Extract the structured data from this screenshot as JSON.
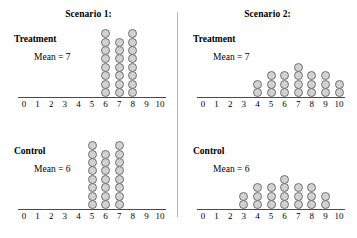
{
  "figure": {
    "axis": {
      "min": 0,
      "max": 10,
      "tick_labels": [
        "0",
        "1",
        "2",
        "3",
        "4",
        "5",
        "6",
        "7",
        "8",
        "9",
        "10"
      ]
    },
    "style": {
      "dot_fill": "#d2d2d2",
      "dot_stroke": "#6f6f6f",
      "axis_color": "#4a4a4a",
      "divider_color": "#b9b9b9",
      "text_color": "#000000"
    }
  },
  "scenarios": [
    {
      "title": "Scenario 1:",
      "panels": [
        {
          "group_label": "Treatment",
          "mean_label": "Mean = 7",
          "chart_data": {
            "type": "bar",
            "title": "Scenario 1: Treatment",
            "subtitle": "Mean = 7",
            "xlabel": "",
            "ylabel": "",
            "categories": [
              "0",
              "1",
              "2",
              "3",
              "4",
              "5",
              "6",
              "7",
              "8",
              "9",
              "10"
            ],
            "values": [
              0,
              0,
              0,
              0,
              0,
              0,
              8,
              7,
              8,
              0,
              0
            ],
            "xlim": [
              0,
              10
            ],
            "ylim": [
              0,
              8
            ],
            "grid": false,
            "legend": "none",
            "mean": 7,
            "n": 23
          }
        },
        {
          "group_label": "Control",
          "mean_label": "Mean = 6",
          "chart_data": {
            "type": "bar",
            "title": "Scenario 1: Control",
            "subtitle": "Mean = 6",
            "xlabel": "",
            "ylabel": "",
            "categories": [
              "0",
              "1",
              "2",
              "3",
              "4",
              "5",
              "6",
              "7",
              "8",
              "9",
              "10"
            ],
            "values": [
              0,
              0,
              0,
              0,
              0,
              8,
              7,
              8,
              0,
              0,
              0
            ],
            "xlim": [
              0,
              10
            ],
            "ylim": [
              0,
              8
            ],
            "grid": false,
            "legend": "none",
            "mean": 6,
            "n": 23
          }
        }
      ]
    },
    {
      "title": "Scenario 2:",
      "panels": [
        {
          "group_label": "Treatment",
          "mean_label": "Mean = 7",
          "chart_data": {
            "type": "bar",
            "title": "Scenario 2: Treatment",
            "subtitle": "Mean = 7",
            "xlabel": "",
            "ylabel": "",
            "categories": [
              "0",
              "1",
              "2",
              "3",
              "4",
              "5",
              "6",
              "7",
              "8",
              "9",
              "10"
            ],
            "values": [
              0,
              0,
              0,
              0,
              2,
              3,
              3,
              4,
              3,
              3,
              2
            ],
            "xlim": [
              0,
              10
            ],
            "ylim": [
              0,
              8
            ],
            "grid": false,
            "legend": "none",
            "mean": 7,
            "n": 20
          }
        },
        {
          "group_label": "Control",
          "mean_label": "Mean = 6",
          "chart_data": {
            "type": "bar",
            "title": "Scenario 2: Control",
            "subtitle": "Mean = 6",
            "xlabel": "",
            "ylabel": "",
            "categories": [
              "0",
              "1",
              "2",
              "3",
              "4",
              "5",
              "6",
              "7",
              "8",
              "9",
              "10"
            ],
            "values": [
              0,
              0,
              0,
              2,
              3,
              3,
              4,
              3,
              3,
              2,
              0
            ],
            "xlim": [
              0,
              10
            ],
            "ylim": [
              0,
              8
            ],
            "grid": false,
            "legend": "none",
            "mean": 6,
            "n": 20
          }
        }
      ]
    }
  ]
}
